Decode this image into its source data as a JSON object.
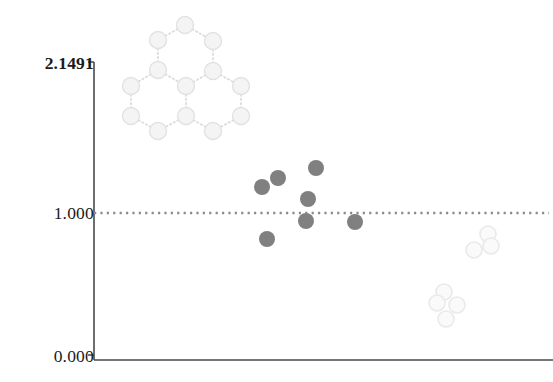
{
  "figure": {
    "background": "#ffffff",
    "width": 553,
    "height": 382
  },
  "axis": {
    "line_color": "#4a4a4a",
    "y_axis": {
      "x": 94,
      "y_top": 62,
      "y_bottom": 360
    },
    "x_axis": {
      "y": 360,
      "x_left": 94,
      "x_right": 553
    },
    "tick_top": {
      "label": "2.1491",
      "y": 62,
      "bold": true
    },
    "tick_mid": {
      "label": "1.000",
      "y": 213,
      "bold": false
    },
    "tick_bottom": {
      "label": "0.000",
      "y": 355,
      "bold": false
    }
  },
  "reference_line": {
    "value_label": "1.000",
    "y": 213,
    "x_start": 94,
    "x_end": 549,
    "style": "dotted",
    "color": "#8c8c8c"
  },
  "molecule": {
    "name": "triangulene-fused-hexagons",
    "node_fill": "#f4f4f4",
    "node_stroke": "#e2e2e2",
    "bond_color": "#d8d8d8",
    "bond_style": "dotted",
    "node_radius": 8.5,
    "nodes": [
      {
        "id": 0,
        "x": 185,
        "y": 25
      },
      {
        "id": 1,
        "x": 158,
        "y": 40
      },
      {
        "id": 2,
        "x": 213,
        "y": 41
      },
      {
        "id": 3,
        "x": 158,
        "y": 70
      },
      {
        "id": 4,
        "x": 213,
        "y": 71
      },
      {
        "id": 5,
        "x": 131,
        "y": 86
      },
      {
        "id": 6,
        "x": 186,
        "y": 86
      },
      {
        "id": 7,
        "x": 241,
        "y": 86
      },
      {
        "id": 8,
        "x": 131,
        "y": 116
      },
      {
        "id": 9,
        "x": 186,
        "y": 116
      },
      {
        "id": 10,
        "x": 241,
        "y": 116
      },
      {
        "id": 11,
        "x": 158,
        "y": 131
      },
      {
        "id": 12,
        "x": 213,
        "y": 131
      }
    ],
    "bonds": [
      [
        0,
        1
      ],
      [
        0,
        2
      ],
      [
        1,
        3
      ],
      [
        2,
        4
      ],
      [
        3,
        6
      ],
      [
        4,
        6
      ],
      [
        3,
        5
      ],
      [
        4,
        7
      ],
      [
        5,
        8
      ],
      [
        7,
        10
      ],
      [
        6,
        9
      ],
      [
        8,
        11
      ],
      [
        9,
        11
      ],
      [
        9,
        12
      ],
      [
        10,
        12
      ]
    ]
  },
  "chart_data": {
    "type": "scatter",
    "title": "",
    "xlabel": "",
    "ylabel": "",
    "ylim": [
      0.0,
      2.1491
    ],
    "ytick_values": [
      0.0,
      1.0,
      2.1491
    ],
    "ytick_labels": [
      "0.000",
      "1.000",
      "2.1491"
    ],
    "grid": false,
    "legend": "none",
    "reference_lines": [
      {
        "y": 1.0,
        "label": "1.000",
        "style": "dotted",
        "color": "#8c8c8c"
      }
    ],
    "series": [
      {
        "name": "filled",
        "marker": "filled-circle",
        "color": "#808080",
        "radius": 8,
        "points": [
          {
            "px": 278,
            "py": 178,
            "value": 1.283
          },
          {
            "px": 262,
            "py": 187,
            "value": 1.222
          },
          {
            "px": 316,
            "py": 168,
            "value": 1.351
          },
          {
            "px": 308,
            "py": 199,
            "value": 1.141
          },
          {
            "px": 306,
            "py": 221,
            "value": 0.945
          },
          {
            "px": 267,
            "py": 239,
            "value": 0.824
          },
          {
            "px": 355,
            "py": 222,
            "value": 0.938
          }
        ]
      },
      {
        "name": "open",
        "marker": "open-circle",
        "color": "#fafafa",
        "stroke": "#eaeaea",
        "radius": 8,
        "points": [
          {
            "px": 488,
            "py": 234,
            "value": 0.858
          },
          {
            "px": 491,
            "py": 246,
            "value": 0.777
          },
          {
            "px": 474,
            "py": 250,
            "value": 0.75
          },
          {
            "px": 444,
            "py": 292,
            "value": 0.464
          },
          {
            "px": 437,
            "py": 303,
            "value": 0.39
          },
          {
            "px": 457,
            "py": 305,
            "value": 0.376
          },
          {
            "px": 446,
            "py": 319,
            "value": 0.282
          }
        ]
      }
    ]
  }
}
